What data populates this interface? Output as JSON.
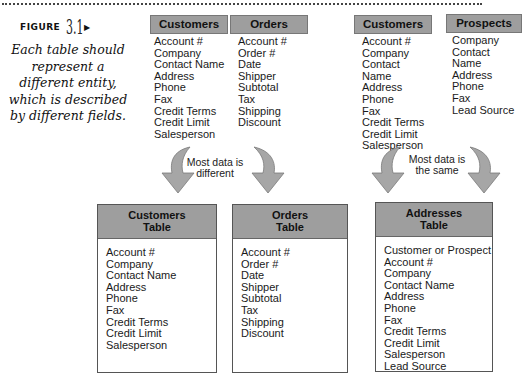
{
  "figure": {
    "label_word": "FIGURE",
    "label_number": "3.1",
    "caption": "Each table should represent a different entity, which is described by different fields."
  },
  "sources": [
    {
      "title": "Customers",
      "fields": [
        "Account #",
        "Company",
        "Contact Name",
        "Address",
        "Phone",
        "Fax",
        "Credit Terms",
        "Credit Limit",
        "Salesperson"
      ]
    },
    {
      "title": "Orders",
      "fields": [
        "Account #",
        "Order #",
        "Date",
        "Shipper",
        "Subtotal",
        "Tax",
        "Shipping",
        "Discount"
      ]
    },
    {
      "title": "Customers",
      "fields": [
        "Account #",
        "Company",
        "Contact Name",
        "Address",
        "Phone",
        "Fax",
        "Credit Terms",
        "Credit Limit",
        "Salesperson"
      ]
    },
    {
      "title": "Prospects",
      "fields": [
        "Company",
        "Contact Name",
        "Address",
        "Phone",
        "Fax",
        "Lead Source"
      ]
    }
  ],
  "notes": {
    "left": "Most data is different",
    "right": "Most data is the same"
  },
  "tables": [
    {
      "title_line1": "Customers",
      "title_line2": "Table",
      "fields": [
        "Account #",
        "Company",
        "Contact Name",
        "Address",
        "Phone",
        "Fax",
        "Credit Terms",
        "Credit Limit",
        "Salesperson"
      ]
    },
    {
      "title_line1": "Orders",
      "title_line2": "Table",
      "fields": [
        "Account #",
        "Order #",
        "Date",
        "Shipper",
        "Subtotal",
        "Tax",
        "Shipping",
        "Discount"
      ]
    },
    {
      "title_line1": "Addresses",
      "title_line2": "Table",
      "fields": [
        "Customer or Prospect",
        "Account #",
        "Company",
        "Contact Name",
        "Address",
        "Phone",
        "Fax",
        "Credit Terms",
        "Credit Limit",
        "Salesperson",
        "Lead Source"
      ]
    }
  ],
  "colors": {
    "header_fill": "#9e9e9e",
    "arrow_fill": "#a6a6a6",
    "arrow_stroke": "#7a7a7a"
  }
}
